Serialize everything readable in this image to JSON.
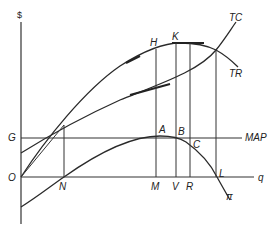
{
  "diagram": {
    "type": "economics-profit-maximization",
    "axes": {
      "y_label": "$",
      "x_label": "q",
      "origin_label": "O"
    },
    "curves": {
      "total_cost": "TC",
      "total_revenue": "TR",
      "profit": "π",
      "minimum_acceptable_profit": "MAP"
    },
    "points": {
      "g": "G",
      "h": "H",
      "k": "K",
      "a": "A",
      "b": "B",
      "c": "C",
      "l": "L",
      "n": "N",
      "m": "M",
      "v": "V",
      "r": "R"
    }
  }
}
